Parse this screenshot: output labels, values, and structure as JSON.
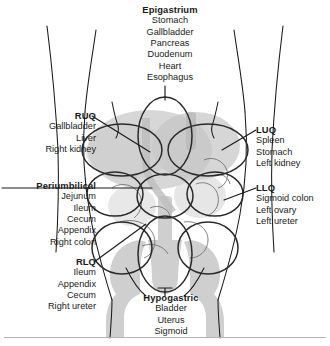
{
  "figure": {
    "colors": {
      "outline": "#1a1a1a",
      "region_ellipse": "#2b2b2b",
      "organ_shade": "#c9c9c9",
      "skeleton_shade": "#cfcfcf",
      "rule": "#b4b4b4",
      "background": "#ffffff"
    }
  },
  "labels": {
    "epigastrium": {
      "heading": "Epigastrium",
      "items": [
        "Stomach",
        "Gallbladder",
        "Pancreas",
        "Duodenum",
        "Heart",
        "Esophagus"
      ]
    },
    "ruq": {
      "heading": "RUQ",
      "items": [
        "Gallbladder",
        "Liver",
        "Right kidney"
      ]
    },
    "periumbilical": {
      "heading": "Periumbilical",
      "items": [
        "Jejunum",
        "Ileum",
        "Cecum",
        "Appendix",
        "Right colon"
      ]
    },
    "rlq": {
      "heading": "RLQ",
      "items": [
        "Ileum",
        "Appendix",
        "Cecum",
        "Right ureter"
      ]
    },
    "luq": {
      "heading": "LUQ",
      "items": [
        "Spleen",
        "Stomach",
        "Left kidney"
      ]
    },
    "llq": {
      "heading": "LLQ",
      "items": [
        "Sigmoid colon",
        "Left ovary",
        "Left ureter"
      ]
    },
    "hypogastric": {
      "heading": "Hypogastric",
      "items": [
        "Bladder",
        "Uterus",
        "Sigmoid"
      ]
    }
  }
}
